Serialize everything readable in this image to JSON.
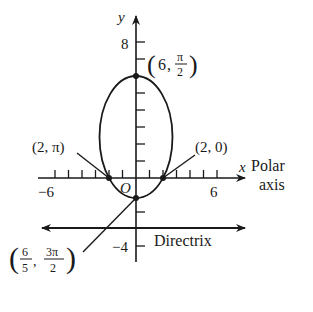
{
  "diagram": {
    "axis_labels": {
      "y": "y",
      "x": "x",
      "polar_axis_line1": "Polar",
      "polar_axis_line2": "axis",
      "origin": "O"
    },
    "tick_labels": {
      "y_top": "8",
      "y_bottom": "−4",
      "x_left": "−6",
      "x_right": "6"
    },
    "points": {
      "top": {
        "label_r": "6",
        "label_num": "π",
        "label_den": "2"
      },
      "left": {
        "label": "(2, π)"
      },
      "right": {
        "label": "(2, 0)"
      },
      "bottom": {
        "r_num": "6",
        "r_den": "5",
        "t_num": "3π",
        "t_den": "2"
      }
    },
    "directrix_label": "Directrix",
    "colors": {
      "ink": "#1a1a1a",
      "background": "#ffffff"
    }
  }
}
